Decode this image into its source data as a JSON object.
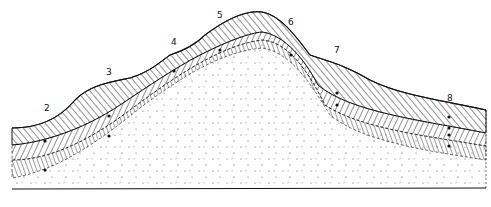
{
  "figure": {
    "type": "geological cross-section (hillslope soil profile)",
    "labels": [
      {
        "text": "2",
        "x": 44,
        "y": 103
      },
      {
        "text": "3",
        "x": 106,
        "y": 67
      },
      {
        "text": "4",
        "x": 171,
        "y": 37
      },
      {
        "text": "5",
        "x": 217,
        "y": 10
      },
      {
        "text": "6",
        "x": 288,
        "y": 17
      },
      {
        "text": "7",
        "x": 334,
        "y": 45
      },
      {
        "text": "8",
        "x": 447,
        "y": 93
      }
    ],
    "colors": {
      "ink": "#111111",
      "background": "#ffffff"
    }
  }
}
